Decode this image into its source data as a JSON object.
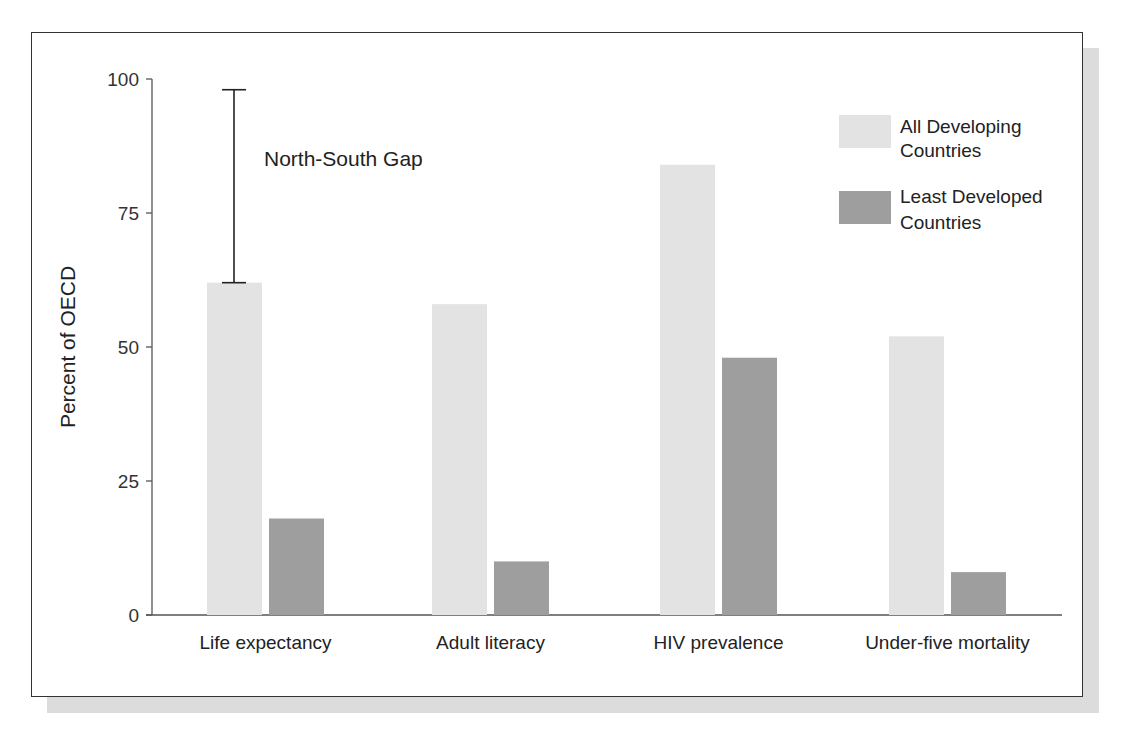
{
  "chart_data": {
    "type": "bar",
    "title": "",
    "xlabel": "",
    "ylabel": "Percent of OECD",
    "ylim": [
      0,
      100
    ],
    "yticks": [
      0,
      25,
      50,
      75,
      100
    ],
    "grid": false,
    "legend_position": "top-right",
    "categories": [
      "Life expectancy",
      "Adult literacy",
      "HIV prevalence",
      "Under-five mortality"
    ],
    "series": [
      {
        "name": "All Developing Countries",
        "color": "#e3e3e3",
        "values": [
          62,
          58,
          84,
          52
        ]
      },
      {
        "name": "Least Developed Countries",
        "color": "#9e9e9e",
        "values": [
          18,
          10,
          48,
          8
        ]
      }
    ],
    "annotations": [
      {
        "type": "range-bar",
        "label": "North-South Gap",
        "category": "Life expectancy",
        "from": 62,
        "to": 98
      }
    ]
  },
  "axis": {
    "ylabel": "Percent of OECD",
    "ticks": [
      "0",
      "25",
      "50",
      "75",
      "100"
    ]
  },
  "categories": [
    "Life expectancy",
    "Adult literacy",
    "HIV prevalence",
    "Under-five mortality"
  ],
  "legend": {
    "all_line1": "All Developing",
    "all_line2": "Countries",
    "least_line1": "Least Developed",
    "least_line2": "Countries"
  },
  "annotation": {
    "label": "North-South Gap"
  }
}
